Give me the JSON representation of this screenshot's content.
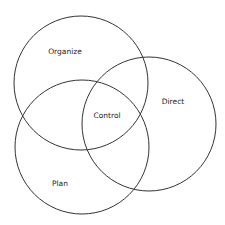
{
  "diagram": {
    "type": "venn",
    "stroke_color": "#333333",
    "circles": [
      {
        "label": "Organize",
        "cx": 81,
        "cy": 83,
        "r": 67
      },
      {
        "label": "Direct",
        "cx": 149,
        "cy": 124,
        "r": 67
      },
      {
        "label": "Plan",
        "cx": 82,
        "cy": 147,
        "r": 67
      }
    ],
    "labels": {
      "organize": "Organize",
      "direct": "Direct",
      "plan": "Plan",
      "control": "Control"
    }
  }
}
